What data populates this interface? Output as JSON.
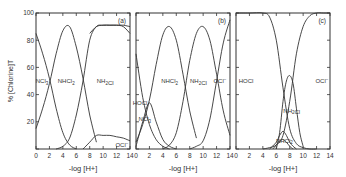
{
  "figure": {
    "ylabel": "% [Chlorine]T",
    "xlabel": "-log [H+]",
    "x_ticks": [
      0,
      2,
      4,
      6,
      8,
      10,
      12,
      14
    ],
    "y_ticks": [
      0,
      20,
      40,
      60,
      80,
      100
    ],
    "line_color": "#333333"
  },
  "chart_data": [
    {
      "type": "line",
      "panel_label": "(a)",
      "xlabel": "-log [H+]",
      "ylabel": "% [Chlorine]T",
      "xlim": [
        0,
        14
      ],
      "ylim": [
        0,
        100
      ],
      "series": [
        {
          "name": "NCl3",
          "label_pos": [
            0.9,
            50
          ],
          "x": [
            0,
            1,
            2,
            3,
            4,
            5,
            6
          ],
          "values": [
            85,
            70,
            52,
            30,
            12,
            3,
            0
          ]
        },
        {
          "name": "NHCl2",
          "label_pos": [
            4.5,
            50
          ],
          "x": [
            0,
            1,
            2,
            3,
            4,
            5,
            6,
            7,
            8,
            9
          ],
          "values": [
            15,
            30,
            48,
            70,
            87,
            90,
            75,
            52,
            25,
            5
          ]
        },
        {
          "name": "NH2Cl",
          "label_pos": [
            10.3,
            50
          ],
          "x": [
            3,
            4,
            5,
            6,
            7,
            8,
            9,
            10,
            11,
            12,
            13,
            14
          ],
          "values": [
            0,
            2,
            8,
            25,
            50,
            80,
            90,
            91,
            91,
            91,
            91,
            90
          ]
        },
        {
          "name": "OCl-",
          "label_pos": [
            12.8,
            3
          ],
          "x": [
            7,
            8,
            9,
            10,
            11,
            12,
            13,
            14
          ],
          "values": [
            0,
            5,
            10,
            10,
            10,
            9,
            8,
            6
          ]
        },
        {
          "name": "upper-boundary",
          "x": [
            8,
            9,
            10,
            11,
            12,
            13,
            14
          ],
          "values": [
            85,
            90,
            91,
            91,
            91,
            90,
            85
          ]
        }
      ]
    },
    {
      "type": "line",
      "panel_label": "(b)",
      "xlabel": "-log [H+]",
      "ylabel": "% [Chlorine]T",
      "xlim": [
        0,
        14
      ],
      "ylim": [
        0,
        100
      ],
      "series": [
        {
          "name": "HOCl",
          "label_pos": [
            0.6,
            34
          ],
          "x": [
            0,
            1,
            2,
            3,
            4,
            5
          ],
          "values": [
            70,
            38,
            18,
            7,
            2,
            0
          ]
        },
        {
          "name": "NCl3",
          "label_pos": [
            1.3,
            22
          ],
          "x": [
            0,
            1,
            2,
            3,
            4,
            5,
            6
          ],
          "values": [
            2,
            20,
            34,
            20,
            7,
            2,
            0
          ]
        },
        {
          "name": "NHCl2",
          "label_pos": [
            5.0,
            50
          ],
          "x": [
            0,
            1,
            2,
            3,
            4,
            5,
            6,
            7,
            8,
            9
          ],
          "values": [
            5,
            18,
            36,
            62,
            84,
            90,
            80,
            55,
            28,
            8
          ]
        },
        {
          "name": "NH2Cl",
          "label_pos": [
            9.3,
            50
          ],
          "x": [
            4,
            5,
            6,
            7,
            8,
            9,
            10,
            11,
            12,
            13,
            14
          ],
          "values": [
            0,
            3,
            12,
            35,
            65,
            85,
            90,
            80,
            55,
            28,
            10
          ]
        },
        {
          "name": "OCl-",
          "label_pos": [
            12.5,
            50
          ],
          "x": [
            8,
            9,
            10,
            11,
            12,
            13,
            14
          ],
          "values": [
            0,
            2,
            6,
            22,
            50,
            78,
            95
          ]
        }
      ]
    },
    {
      "type": "line",
      "panel_label": "(c)",
      "xlabel": "-log [H+]",
      "ylabel": "% [Chlorine]T",
      "xlim": [
        0,
        14
      ],
      "ylim": [
        0,
        100
      ],
      "series": [
        {
          "name": "HOCl",
          "label_pos": [
            1.5,
            50
          ],
          "x": [
            0,
            2,
            4,
            5,
            6,
            7,
            8,
            9,
            10,
            11,
            12
          ],
          "values": [
            100,
            100,
            100,
            97,
            80,
            45,
            15,
            4,
            1,
            0,
            0
          ]
        },
        {
          "name": "OCl-",
          "label_pos": [
            12.8,
            50
          ],
          "x": [
            4,
            5,
            6,
            7,
            8,
            9,
            10,
            11,
            12,
            13,
            14
          ],
          "values": [
            0,
            1,
            3,
            10,
            35,
            70,
            90,
            98,
            100,
            100,
            100
          ]
        },
        {
          "name": "NH2Cl",
          "label_pos": [
            8.3,
            28
          ],
          "x": [
            6,
            6.5,
            7,
            7.5,
            8,
            8.5,
            9,
            9.5,
            10
          ],
          "values": [
            0,
            12,
            35,
            50,
            54,
            48,
            30,
            12,
            2
          ]
        },
        {
          "name": "NHCl2",
          "label_pos": [
            7.2,
            6
          ],
          "x": [
            5,
            6,
            6.5,
            7,
            7.5,
            8,
            8.5,
            9
          ],
          "values": [
            0,
            5,
            10,
            13,
            10,
            5,
            2,
            0
          ]
        },
        {
          "name": "NCl3",
          "x": [
            5.5,
            6,
            6.5,
            7,
            7.5,
            8,
            8.5
          ],
          "values": [
            0,
            3,
            6,
            7,
            5,
            2,
            0
          ]
        }
      ]
    }
  ]
}
